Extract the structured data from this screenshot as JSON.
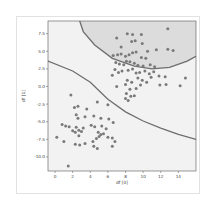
{
  "chart_data": {
    "type": "scatter",
    "title": "",
    "xlabel": "df [0]",
    "ylabel": "df [1]",
    "xlim": [
      -0.8,
      16
    ],
    "ylim": [
      -12,
      9.3
    ],
    "xticks": [
      "0",
      "2",
      "4",
      "6",
      "8",
      "10",
      "12",
      "14"
    ],
    "yticks": [
      "7.5",
      "5.0",
      "2.5",
      "0.0",
      "-2.5",
      "-5.0",
      "-7.5",
      "-10.0"
    ],
    "grid": false,
    "legend": null,
    "colors": {
      "points": "#7a7a7a",
      "boundary": "#6e6e6e",
      "inner_region": "#dcdcdc",
      "outer_region": "#f2f2f2"
    },
    "decision_boundaries": [
      {
        "name": "linear-boundary",
        "points": [
          [
            -0.8,
            3.6
          ],
          [
            2,
            2.2
          ],
          [
            4,
            0.6
          ],
          [
            6,
            -1.8
          ],
          [
            8,
            -3.6
          ],
          [
            10,
            -4.9
          ],
          [
            12,
            -5.9
          ],
          [
            14,
            -6.8
          ],
          [
            16,
            -7.5
          ]
        ]
      },
      {
        "name": "elliptical-boundary",
        "points": [
          [
            2.8,
            9.3
          ],
          [
            3.2,
            7.8
          ],
          [
            4.5,
            5.9
          ],
          [
            6.5,
            4.0
          ],
          [
            9,
            2.9
          ],
          [
            11,
            2.5
          ],
          [
            13,
            2.7
          ],
          [
            15,
            3.6
          ],
          [
            16,
            4.3
          ]
        ]
      }
    ],
    "series": [
      {
        "name": "cluster-1",
        "points": [
          [
            7.0,
            6.9
          ],
          [
            8.2,
            7.5
          ],
          [
            8.8,
            7.4
          ],
          [
            9.8,
            7.4
          ],
          [
            12.8,
            8.2
          ],
          [
            7.5,
            5.6
          ],
          [
            8.7,
            6.4
          ],
          [
            9.1,
            6.5
          ],
          [
            9.9,
            6.1
          ],
          [
            10.5,
            5.0
          ],
          [
            11.5,
            5.2
          ],
          [
            12.8,
            5.3
          ],
          [
            13.4,
            5.1
          ],
          [
            6.6,
            4.4
          ],
          [
            7.1,
            4.5
          ],
          [
            7.5,
            4.6
          ],
          [
            8.0,
            4.3
          ],
          [
            8.4,
            4.5
          ],
          [
            8.8,
            4.8
          ],
          [
            9.2,
            4.9
          ],
          [
            9.8,
            4.1
          ],
          [
            10.3,
            4.0
          ],
          [
            6.9,
            3.4
          ],
          [
            7.3,
            3.2
          ],
          [
            7.8,
            3.1
          ],
          [
            8.1,
            3.6
          ],
          [
            8.5,
            3.5
          ],
          [
            9.0,
            3.3
          ],
          [
            9.4,
            3.0
          ],
          [
            10.0,
            2.9
          ],
          [
            10.8,
            3.1
          ],
          [
            11.3,
            2.8
          ],
          [
            6.8,
            2.4
          ],
          [
            7.2,
            2.0
          ],
          [
            7.6,
            2.2
          ],
          [
            8.3,
            2.3
          ],
          [
            8.8,
            2.5
          ],
          [
            9.2,
            1.9
          ],
          [
            9.6,
            2.0
          ],
          [
            10.2,
            2.2
          ],
          [
            10.7,
            1.8
          ],
          [
            11.2,
            2.1
          ],
          [
            11.8,
            1.5
          ],
          [
            12.5,
            1.4
          ],
          [
            6.5,
            1.6
          ],
          [
            8.2,
            0.9
          ],
          [
            8.7,
            0.6
          ],
          [
            9.4,
            1.2
          ],
          [
            9.9,
            0.9
          ],
          [
            10.4,
            0.6
          ],
          [
            10.9,
            1.3
          ],
          [
            11.9,
            0.2
          ],
          [
            12.6,
            0.3
          ],
          [
            14.2,
            0.1
          ],
          [
            14.8,
            1.2
          ],
          [
            7.0,
            0.0
          ],
          [
            8.0,
            0.3
          ],
          [
            8.5,
            -0.4
          ],
          [
            9.2,
            -0.3
          ],
          [
            9.7,
            0.2
          ],
          [
            8.1,
            -1.0
          ],
          [
            8.6,
            -1.4
          ],
          [
            9.0,
            -1.3
          ],
          [
            8.0,
            -1.7
          ],
          [
            8.3,
            -2.0
          ]
        ]
      },
      {
        "name": "cluster-2",
        "points": [
          [
            1.8,
            -1.2
          ],
          [
            4.8,
            -2.2
          ],
          [
            6.0,
            -2.6
          ],
          [
            2.2,
            -3.0
          ],
          [
            2.6,
            -2.8
          ],
          [
            3.6,
            -3.2
          ],
          [
            2.4,
            -4.0
          ],
          [
            2.6,
            -4.5
          ],
          [
            3.4,
            -4.3
          ],
          [
            4.4,
            -4.2
          ],
          [
            5.2,
            -4.5
          ],
          [
            6.1,
            -4.6
          ],
          [
            0.8,
            -5.4
          ],
          [
            1.2,
            -5.6
          ],
          [
            1.6,
            -5.7
          ],
          [
            2.4,
            -5.8
          ],
          [
            3.2,
            -5.9
          ],
          [
            4.1,
            -5.5
          ],
          [
            4.5,
            -5.7
          ],
          [
            5.3,
            -5.6
          ],
          [
            5.8,
            -6.0
          ],
          [
            6.6,
            -5.1
          ],
          [
            2.0,
            -6.3
          ],
          [
            2.3,
            -6.5
          ],
          [
            2.7,
            -6.2
          ],
          [
            3.0,
            -6.4
          ],
          [
            4.9,
            -6.5
          ],
          [
            5.2,
            -6.8
          ],
          [
            5.5,
            -6.7
          ],
          [
            6.0,
            -7.2
          ],
          [
            6.5,
            -7.3
          ],
          [
            1.0,
            -7.8
          ],
          [
            2.7,
            -7.0
          ],
          [
            4.3,
            -7.8
          ],
          [
            4.7,
            -7.4
          ],
          [
            5.0,
            -7.1
          ],
          [
            6.8,
            -7.8
          ],
          [
            2.3,
            -8.2
          ],
          [
            2.8,
            -8.3
          ],
          [
            3.4,
            -8.1
          ],
          [
            4.4,
            -8.5
          ],
          [
            4.8,
            -8.8
          ],
          [
            6.5,
            -8.5
          ],
          [
            0.2,
            -7.2
          ],
          [
            1.5,
            -11.3
          ]
        ]
      }
    ]
  }
}
